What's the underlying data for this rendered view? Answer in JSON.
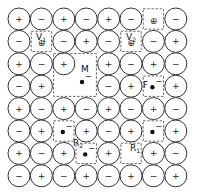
{
  "diagram": {
    "title": "",
    "grid": {
      "cols": 8,
      "rows": 8,
      "origin_x": 19,
      "origin_y": 19,
      "pitch": 22.4,
      "radius": 11
    },
    "colors": {
      "stroke": "#333333",
      "background": "#ffffff",
      "electron": "#111111"
    },
    "rows": [
      [
        "+",
        "-",
        "+",
        "-",
        "+",
        "-",
        "",
        "-"
      ],
      [
        "-",
        "",
        "-",
        "+",
        "-",
        "",
        "-",
        "+"
      ],
      [
        "+",
        "-",
        "+",
        "",
        "+",
        "-",
        "+",
        "-"
      ],
      [
        "-",
        "+",
        "",
        "",
        "-",
        "+",
        "",
        "+"
      ],
      [
        "+",
        "-",
        "+",
        "-",
        "+",
        "-",
        "+",
        "-"
      ],
      [
        "-",
        "+",
        "",
        "+",
        "-",
        "+",
        "",
        "+"
      ],
      [
        "+",
        "-",
        "+",
        "",
        "+",
        "",
        "+",
        "-"
      ],
      [
        "-",
        "+",
        "-",
        "+",
        "-",
        "+",
        "-",
        "+"
      ]
    ],
    "defects": [
      {
        "id": "interstitial-top",
        "label": "",
        "sub": "",
        "col": 6,
        "row": 0,
        "w": 1,
        "h": 1,
        "content": "⊕"
      },
      {
        "id": "V1",
        "label": "V",
        "sub": "1",
        "col": 1,
        "row": 1,
        "w": 1,
        "h": 1,
        "content": "⊕"
      },
      {
        "id": "V2",
        "label": "V",
        "sub": "2",
        "col": 5,
        "row": 1,
        "w": 1,
        "h": 1,
        "content": "⊕"
      },
      {
        "id": "M",
        "label": "M",
        "sub": "",
        "col": 2,
        "row": 2,
        "w": 2,
        "h": 2,
        "content": "•⁻"
      },
      {
        "id": "F",
        "label": "F",
        "sub": "",
        "col": 6,
        "row": 3,
        "w": 1,
        "h": 1,
        "content": "•⁻"
      },
      {
        "id": "R2a",
        "label": "",
        "sub": "",
        "col": 2,
        "row": 5,
        "w": 1,
        "h": 1,
        "content": "•⁻"
      },
      {
        "id": "R2b",
        "label": "R",
        "sub": "2",
        "col": 3,
        "row": 6,
        "w": 1,
        "h": 1,
        "content": "•⁻"
      },
      {
        "id": "R1a",
        "label": "",
        "sub": "",
        "col": 6,
        "row": 5,
        "w": 1,
        "h": 1,
        "content": "•⁻"
      },
      {
        "id": "R1b",
        "label": "R",
        "sub": "1",
        "col": 5,
        "row": 6,
        "w": 1,
        "h": 1,
        "content": ""
      }
    ],
    "labels": {
      "V1": "V",
      "V1_sub": "1",
      "V2": "V",
      "V2_sub": "2",
      "M": "M",
      "F": "F",
      "R1": "R",
      "R1_sub": "1",
      "R2": "R",
      "R2_sub": "2"
    },
    "symbols": {
      "plus": "+",
      "minus": "−",
      "hole": "⊕",
      "electron_charge": "−"
    }
  }
}
